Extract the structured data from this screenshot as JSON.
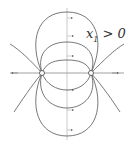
{
  "diagram": {
    "type": "phase-portrait",
    "label_var": "x",
    "label_sub": "1",
    "label_rel": " > 0",
    "fixed_points": [
      {
        "name": "left-fixed-point",
        "x": 42,
        "y": 73
      },
      {
        "name": "right-fixed-point",
        "x": 91,
        "y": 73
      }
    ],
    "colors": {
      "curve": "#555555",
      "axis": "#888888",
      "background": "#ffffff"
    }
  }
}
